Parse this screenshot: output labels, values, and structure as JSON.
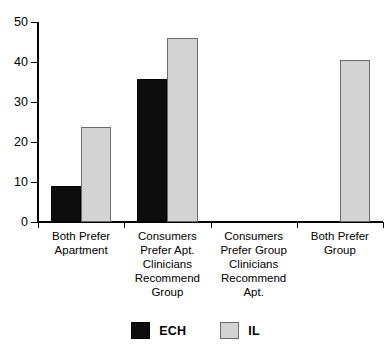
{
  "chart_data": {
    "type": "bar",
    "title": "",
    "subtitle": "",
    "xlabel": "",
    "ylabel": "",
    "ylim": [
      0,
      50
    ],
    "yticks": [
      0,
      10,
      20,
      30,
      40,
      50
    ],
    "ytick_labels": [
      "0",
      "10",
      "20",
      "30",
      "40",
      "50"
    ],
    "grid": false,
    "legend_position": "bottom-center",
    "categories": [
      "Both Prefer\nApartment",
      "Consumers\nPrefer Apt.\nClinicians\nRecommend\nGroup",
      "Consumers\nPrefer Group\nClinicians\nRecommend\nApt.",
      "Both Prefer\nGroup"
    ],
    "series": [
      {
        "name": "ECH",
        "color": "#0d0d0d",
        "values": [
          9,
          35.7,
          0,
          0
        ]
      },
      {
        "name": "IL",
        "color": "#d3d3d3",
        "values": [
          23.7,
          46,
          0,
          40.6
        ]
      }
    ]
  },
  "legend": {
    "entries": [
      {
        "label": "ECH",
        "swatch": "black-square-swatch"
      },
      {
        "label": "IL",
        "swatch": "gray-square-swatch"
      }
    ]
  }
}
